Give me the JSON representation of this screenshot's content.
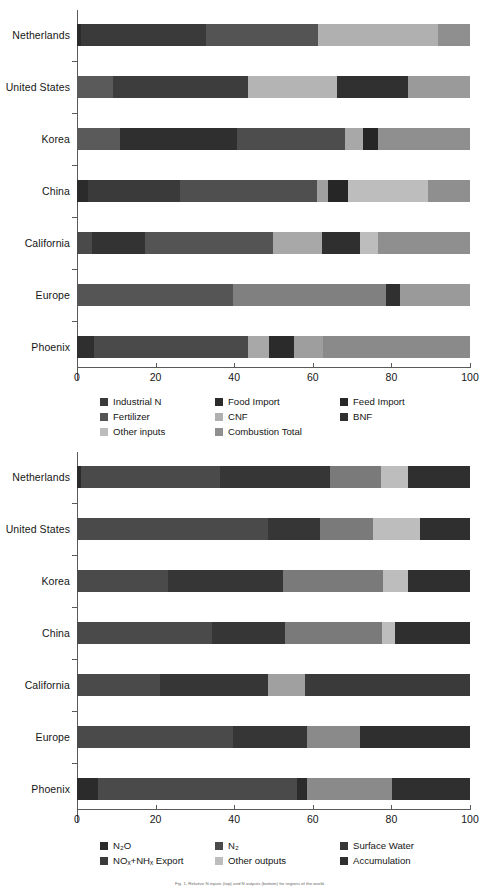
{
  "chart_data": [
    {
      "type": "bar",
      "orientation": "horizontal",
      "stacked": true,
      "normalized": true,
      "title": "",
      "xlabel": "",
      "ylabel": "",
      "xlim": [
        0,
        100
      ],
      "xticks": [
        0,
        20,
        40,
        60,
        80,
        100
      ],
      "xtick_labels": [
        "0",
        "20",
        "40",
        "60",
        "80",
        "100"
      ],
      "grid": false,
      "legend_position": "below",
      "categories": [
        "Netherlands",
        "United States",
        "Korea",
        "China",
        "California",
        "Europe",
        "Phoenix"
      ],
      "series": [
        {
          "name": "Industrial N",
          "color": "#2b2b2b",
          "values": [
            1,
            9,
            11,
            3,
            4,
            0,
            4
          ]
        },
        {
          "name": "Food Import",
          "color": "#3a3a3a",
          "values": [
            32,
            0,
            19,
            23,
            13,
            0,
            0
          ]
        },
        {
          "name": "Feed Import",
          "color": "#272727",
          "values": [
            0,
            0,
            0,
            0,
            0,
            0,
            0
          ]
        },
        {
          "name": "Fertilizer",
          "color": "#545454",
          "values": [
            28,
            35,
            27,
            35,
            33,
            40,
            40
          ]
        },
        {
          "name": "CNF",
          "color": "#a8a8a8",
          "values": [
            30,
            23,
            5,
            3,
            12,
            0,
            5
          ]
        },
        {
          "name": "BNF",
          "color": "#303030",
          "values": [
            0,
            18,
            5,
            5,
            10,
            3,
            6
          ]
        },
        {
          "name": "Other inputs",
          "color": "#bdbdbd",
          "values": [
            0,
            0,
            0,
            5,
            5,
            0,
            0
          ]
        },
        {
          "name": "Combustion Total",
          "color": "#8f8f8f",
          "values": [
            9,
            15,
            33,
            26,
            23,
            57,
            45
          ]
        }
      ],
      "legend_entries": [
        "Industrial N",
        "Food Import",
        "Feed Import",
        "Fertilizer",
        "CNF",
        "BNF",
        "Other inputs",
        "Combustion Total"
      ]
    },
    {
      "type": "bar",
      "orientation": "horizontal",
      "stacked": true,
      "normalized": true,
      "title": "",
      "xlabel": "",
      "ylabel": "",
      "xlim": [
        0,
        100
      ],
      "xticks": [
        0,
        20,
        40,
        60,
        80,
        100
      ],
      "xtick_labels": [
        "0",
        "20",
        "40",
        "60",
        "80",
        "100"
      ],
      "grid": false,
      "legend_position": "below",
      "categories": [
        "Netherlands",
        "United States",
        "Korea",
        "China",
        "California",
        "Europe",
        "Phoenix"
      ],
      "series": [
        {
          "name": "N2O",
          "color": "#2b2b2b",
          "values": [
            1,
            0,
            0,
            0,
            0,
            0,
            5
          ]
        },
        {
          "name": "N2",
          "color": "#4a4a4a",
          "values": [
            35,
            48,
            23,
            34,
            21,
            39,
            50
          ]
        },
        {
          "name": "Surface Water",
          "color": "#363636",
          "values": [
            28,
            13,
            29,
            18,
            27,
            19,
            3
          ]
        },
        {
          "name": "NOx+NHx Export",
          "color": "#7a7a7a",
          "values": [
            13,
            13,
            25,
            24,
            9,
            13,
            21
          ]
        },
        {
          "name": "Other outputs",
          "color": "#bdbdbd",
          "values": [
            7,
            12,
            6,
            3,
            0,
            0,
            0
          ]
        },
        {
          "name": "Accumulation",
          "color": "#2f2f2f",
          "values": [
            16,
            14,
            17,
            21,
            43,
            29,
            21
          ]
        }
      ],
      "legend_entries": [
        "N2O",
        "N2",
        "Surface Water",
        "NOx+NHx Export",
        "Other outputs",
        "Accumulation"
      ]
    }
  ],
  "top_chart": {
    "categories": [
      "Netherlands",
      "United States",
      "Korea",
      "China",
      "California",
      "Europe",
      "Phoenix"
    ],
    "xticks": [
      "0",
      "20",
      "40",
      "60",
      "80",
      "100"
    ],
    "bars": [
      {
        "label": "Netherlands",
        "segments": [
          {
            "x0": 0.0,
            "x1": 1.0,
            "color": "#2b2b2b"
          },
          {
            "x0": 1.0,
            "x1": 32.8,
            "color": "#3a3a3a"
          },
          {
            "x0": 32.8,
            "x1": 61.3,
            "color": "#545454"
          },
          {
            "x0": 61.3,
            "x1": 91.9,
            "color": "#b0b0b0"
          },
          {
            "x0": 91.9,
            "x1": 100.0,
            "color": "#8f8f8f"
          }
        ]
      },
      {
        "label": "United States",
        "segments": [
          {
            "x0": 0.0,
            "x1": 9.2,
            "color": "#5a5a5a"
          },
          {
            "x0": 9.2,
            "x1": 43.5,
            "color": "#3d3d3d"
          },
          {
            "x0": 43.5,
            "x1": 66.2,
            "color": "#b4b4b4"
          },
          {
            "x0": 66.2,
            "x1": 84.2,
            "color": "#303030"
          },
          {
            "x0": 84.2,
            "x1": 100.0,
            "color": "#9a9a9a"
          }
        ]
      },
      {
        "label": "Korea",
        "segments": [
          {
            "x0": 0.0,
            "x1": 10.9,
            "color": "#5a5a5a"
          },
          {
            "x0": 10.9,
            "x1": 40.7,
            "color": "#2f2f2f"
          },
          {
            "x0": 40.7,
            "x1": 68.2,
            "color": "#4d4d4d"
          },
          {
            "x0": 68.2,
            "x1": 72.8,
            "color": "#a8a8a8"
          },
          {
            "x0": 72.8,
            "x1": 76.6,
            "color": "#262626"
          },
          {
            "x0": 76.6,
            "x1": 100.0,
            "color": "#8f8f8f"
          }
        ]
      },
      {
        "label": "China",
        "segments": [
          {
            "x0": 0.0,
            "x1": 2.8,
            "color": "#2b2b2b"
          },
          {
            "x0": 2.8,
            "x1": 26.2,
            "color": "#3a3a3a"
          },
          {
            "x0": 26.2,
            "x1": 61.1,
            "color": "#4f4f4f"
          },
          {
            "x0": 61.1,
            "x1": 63.9,
            "color": "#a0a0a0"
          },
          {
            "x0": 63.9,
            "x1": 69.0,
            "color": "#262626"
          },
          {
            "x0": 69.0,
            "x1": 89.3,
            "color": "#bdbdbd"
          },
          {
            "x0": 89.3,
            "x1": 100.0,
            "color": "#8f8f8f"
          }
        ]
      },
      {
        "label": "California",
        "segments": [
          {
            "x0": 0.0,
            "x1": 3.8,
            "color": "#4a4a4a"
          },
          {
            "x0": 3.8,
            "x1": 17.3,
            "color": "#333333"
          },
          {
            "x0": 17.3,
            "x1": 49.9,
            "color": "#545454"
          },
          {
            "x0": 49.9,
            "x1": 62.3,
            "color": "#a8a8a8"
          },
          {
            "x0": 62.3,
            "x1": 72.0,
            "color": "#2f2f2f"
          },
          {
            "x0": 72.0,
            "x1": 76.6,
            "color": "#bdbdbd"
          },
          {
            "x0": 76.6,
            "x1": 100.0,
            "color": "#8f8f8f"
          }
        ]
      },
      {
        "label": "Europe",
        "segments": [
          {
            "x0": 0.0,
            "x1": 39.7,
            "color": "#555555"
          },
          {
            "x0": 39.7,
            "x1": 78.6,
            "color": "#808080"
          },
          {
            "x0": 78.6,
            "x1": 82.2,
            "color": "#303030"
          },
          {
            "x0": 82.2,
            "x1": 100.0,
            "color": "#9a9a9a"
          }
        ]
      },
      {
        "label": "Phoenix",
        "segments": [
          {
            "x0": 0.0,
            "x1": 4.3,
            "color": "#2f2f2f"
          },
          {
            "x0": 4.3,
            "x1": 43.5,
            "color": "#4a4a4a"
          },
          {
            "x0": 43.5,
            "x1": 48.9,
            "color": "#a8a8a8"
          },
          {
            "x0": 48.9,
            "x1": 55.2,
            "color": "#2b2b2b"
          },
          {
            "x0": 55.2,
            "x1": 62.5,
            "color": "#9e9e9e"
          },
          {
            "x0": 62.5,
            "x1": 100.0,
            "color": "#8a8a8a"
          }
        ]
      }
    ],
    "legend_rows": [
      [
        {
          "label": "Industrial N",
          "color": "#3a3a3a"
        },
        {
          "label": "Food Import",
          "color": "#2b2b2b"
        },
        {
          "label": "Feed Import",
          "color": "#272727"
        }
      ],
      [
        {
          "label": "Fertilizer",
          "color": "#545454"
        },
        {
          "label": "CNF",
          "color": "#b0b0b0"
        },
        {
          "label": "BNF",
          "color": "#303030"
        }
      ],
      [
        {
          "label": "Other inputs",
          "color": "#bdbdbd"
        },
        {
          "label": "Combustion Total",
          "color": "#8f8f8f"
        }
      ]
    ]
  },
  "bottom_chart": {
    "categories": [
      "Netherlands",
      "United States",
      "Korea",
      "China",
      "California",
      "Europe",
      "Phoenix"
    ],
    "xticks": [
      "0",
      "20",
      "40",
      "60",
      "80",
      "100"
    ],
    "bars": [
      {
        "label": "Netherlands",
        "segments": [
          {
            "x0": 0.0,
            "x1": 1.0,
            "color": "#2b2b2b"
          },
          {
            "x0": 1.0,
            "x1": 36.4,
            "color": "#4a4a4a"
          },
          {
            "x0": 36.4,
            "x1": 64.4,
            "color": "#363636"
          },
          {
            "x0": 64.4,
            "x1": 77.4,
            "color": "#7a7a7a"
          },
          {
            "x0": 77.4,
            "x1": 84.2,
            "color": "#bdbdbd"
          },
          {
            "x0": 84.2,
            "x1": 100.0,
            "color": "#2f2f2f"
          }
        ]
      },
      {
        "label": "United States",
        "segments": [
          {
            "x0": 0.0,
            "x1": 48.6,
            "color": "#4a4a4a"
          },
          {
            "x0": 48.6,
            "x1": 61.8,
            "color": "#363636"
          },
          {
            "x0": 61.8,
            "x1": 75.3,
            "color": "#7a7a7a"
          },
          {
            "x0": 75.3,
            "x1": 87.3,
            "color": "#bdbdbd"
          },
          {
            "x0": 87.3,
            "x1": 100.0,
            "color": "#2f2f2f"
          }
        ]
      },
      {
        "label": "Korea",
        "segments": [
          {
            "x0": 0.0,
            "x1": 23.2,
            "color": "#4a4a4a"
          },
          {
            "x0": 23.2,
            "x1": 52.4,
            "color": "#363636"
          },
          {
            "x0": 52.4,
            "x1": 77.9,
            "color": "#7a7a7a"
          },
          {
            "x0": 77.9,
            "x1": 84.2,
            "color": "#bdbdbd"
          },
          {
            "x0": 84.2,
            "x1": 100.0,
            "color": "#2f2f2f"
          }
        ]
      },
      {
        "label": "China",
        "segments": [
          {
            "x0": 0.0,
            "x1": 34.4,
            "color": "#4a4a4a"
          },
          {
            "x0": 34.4,
            "x1": 52.9,
            "color": "#363636"
          },
          {
            "x0": 52.9,
            "x1": 77.6,
            "color": "#7a7a7a"
          },
          {
            "x0": 77.6,
            "x1": 80.9,
            "color": "#bdbdbd"
          },
          {
            "x0": 80.9,
            "x1": 100.0,
            "color": "#2f2f2f"
          }
        ]
      },
      {
        "label": "California",
        "segments": [
          {
            "x0": 0.0,
            "x1": 21.1,
            "color": "#4a4a4a"
          },
          {
            "x0": 21.1,
            "x1": 48.6,
            "color": "#363636"
          },
          {
            "x0": 48.6,
            "x1": 58.0,
            "color": "#a0a0a0"
          },
          {
            "x0": 58.0,
            "x1": 100.0,
            "color": "#3a3a3a"
          }
        ]
      },
      {
        "label": "Europe",
        "segments": [
          {
            "x0": 0.0,
            "x1": 39.7,
            "color": "#4a4a4a"
          },
          {
            "x0": 39.7,
            "x1": 58.5,
            "color": "#363636"
          },
          {
            "x0": 58.5,
            "x1": 72.0,
            "color": "#8a8a8a"
          },
          {
            "x0": 72.0,
            "x1": 100.0,
            "color": "#2f2f2f"
          }
        ]
      },
      {
        "label": "Phoenix",
        "segments": [
          {
            "x0": 0.0,
            "x1": 5.3,
            "color": "#2b2b2b"
          },
          {
            "x0": 5.3,
            "x1": 56.0,
            "color": "#4a4a4a"
          },
          {
            "x0": 56.0,
            "x1": 58.5,
            "color": "#2b2b2b"
          },
          {
            "x0": 58.5,
            "x1": 80.2,
            "color": "#8a8a8a"
          },
          {
            "x0": 80.2,
            "x1": 100.0,
            "color": "#2f2f2f"
          }
        ]
      }
    ],
    "legend_rows": [
      [
        {
          "label": "N₂O",
          "color": "#2b2b2b"
        },
        {
          "label": "N₂",
          "color": "#4a4a4a"
        },
        {
          "label": "Surface Water",
          "color": "#363636"
        }
      ],
      [
        {
          "label": "NOₓ+NHₓ Export",
          "color": "#3a3a3a"
        },
        {
          "label": "Other outputs",
          "color": "#bdbdbd"
        },
        {
          "label": "Accumulation",
          "color": "#2f2f2f"
        }
      ]
    ]
  },
  "footer": {
    "caption": "Fig. 1. Relative N inputs (top) and N outputs (bottom) for regions of the world."
  }
}
